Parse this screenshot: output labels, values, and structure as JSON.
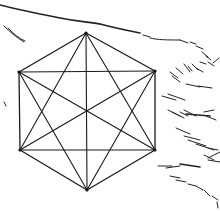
{
  "figure": {
    "colors": {
      "background": "#ffffff",
      "line": "#1a1a1a"
    },
    "vertices": [
      {
        "name": "top",
        "x": 86,
        "y": 33
      },
      {
        "name": "upper-right",
        "x": 155,
        "y": 71
      },
      {
        "name": "lower-right",
        "x": 155,
        "y": 150
      },
      {
        "name": "bottom",
        "x": 87,
        "y": 190
      },
      {
        "name": "lower-left",
        "x": 20,
        "y": 150
      },
      {
        "name": "upper-left",
        "x": 19,
        "y": 72
      }
    ],
    "hatch_strokes": [
      {
        "d": "M0 5 C 20 10, 40 14, 60 18 S 90 22, 100 24",
        "thick": true
      },
      {
        "d": "M100 24 C 115 28, 125 30, 140 33",
        "thick": true
      },
      {
        "d": "M143 35 L 150 37",
        "thick": false
      },
      {
        "d": "M150 38 C 158 40, 168 40, 180 40",
        "thick": false
      },
      {
        "d": "M180 40 L 188 43",
        "thick": false
      },
      {
        "d": "M190 42 L 196 44",
        "thick": false
      },
      {
        "d": "M196 46 L 203 49",
        "thick": false
      },
      {
        "d": "M202 52 L 208 57",
        "thick": false
      },
      {
        "d": "M206 56 L 211 60",
        "thick": false
      },
      {
        "d": "M208 62 L 214 66",
        "thick": false
      },
      {
        "d": "M213 63 L 219 58",
        "thick": false
      },
      {
        "d": "M4 26 C 10 32, 16 37, 24 42",
        "thick": false
      },
      {
        "d": "M8 28 C 14 34, 18 38, 25 41",
        "thick": false
      },
      {
        "d": "M170 72 L 178 78",
        "thick": false
      },
      {
        "d": "M172 76 L 180 82",
        "thick": false
      },
      {
        "d": "M176 68 L 183 74",
        "thick": false
      },
      {
        "d": "M184 64 L 190 72",
        "thick": false
      },
      {
        "d": "M188 66 L 192 71",
        "thick": false
      },
      {
        "d": "M192 64 L 198 70",
        "thick": false
      },
      {
        "d": "M196 68 L 203 72",
        "thick": false
      },
      {
        "d": "M200 62 L 206 64",
        "thick": false
      },
      {
        "d": "M186 84 L 200 87",
        "thick": false
      },
      {
        "d": "M198 86 L 212 88",
        "thick": false
      },
      {
        "d": "M162 96 L 176 100",
        "thick": false
      },
      {
        "d": "M168 94 L 185 100",
        "thick": false
      },
      {
        "d": "M168 110 L 180 116",
        "thick": false
      },
      {
        "d": "M172 112 L 184 118",
        "thick": false
      },
      {
        "d": "M180 112 L 188 116",
        "thick": false
      },
      {
        "d": "M184 110 L 196 116",
        "thick": false
      },
      {
        "d": "M186 114 L 210 116",
        "thick": true
      },
      {
        "d": "M204 112 L 214 110",
        "thick": false
      },
      {
        "d": "M206 116 L 216 120",
        "thick": false
      },
      {
        "d": "M176 128 L 190 134",
        "thick": false
      },
      {
        "d": "M184 136 L 200 140",
        "thick": false
      },
      {
        "d": "M188 140 L 206 146",
        "thick": false
      },
      {
        "d": "M196 144 L 214 150",
        "thick": false
      },
      {
        "d": "M208 148 L 218 150",
        "thick": false
      },
      {
        "d": "M204 155 L 214 160",
        "thick": false
      },
      {
        "d": "M208 160 L 220 162",
        "thick": false
      },
      {
        "d": "M158 166 L 172 166",
        "thick": false
      },
      {
        "d": "M166 168 L 180 166",
        "thick": false
      },
      {
        "d": "M180 164 L 200 167",
        "thick": true
      },
      {
        "d": "M208 158 L 220 152",
        "thick": false
      },
      {
        "d": "M170 176 L 180 178",
        "thick": false
      },
      {
        "d": "M176 180 L 186 182",
        "thick": false
      },
      {
        "d": "M188 184 L 196 186",
        "thick": false
      },
      {
        "d": "M196 186 L 203 190",
        "thick": false
      },
      {
        "d": "M204 190 L 210 196",
        "thick": false
      },
      {
        "d": "M212 196 L 218 200",
        "thick": false
      },
      {
        "d": "M217 202 L 218 208",
        "thick": false
      },
      {
        "d": "M4 102 L 6 106",
        "thick": false
      }
    ]
  }
}
